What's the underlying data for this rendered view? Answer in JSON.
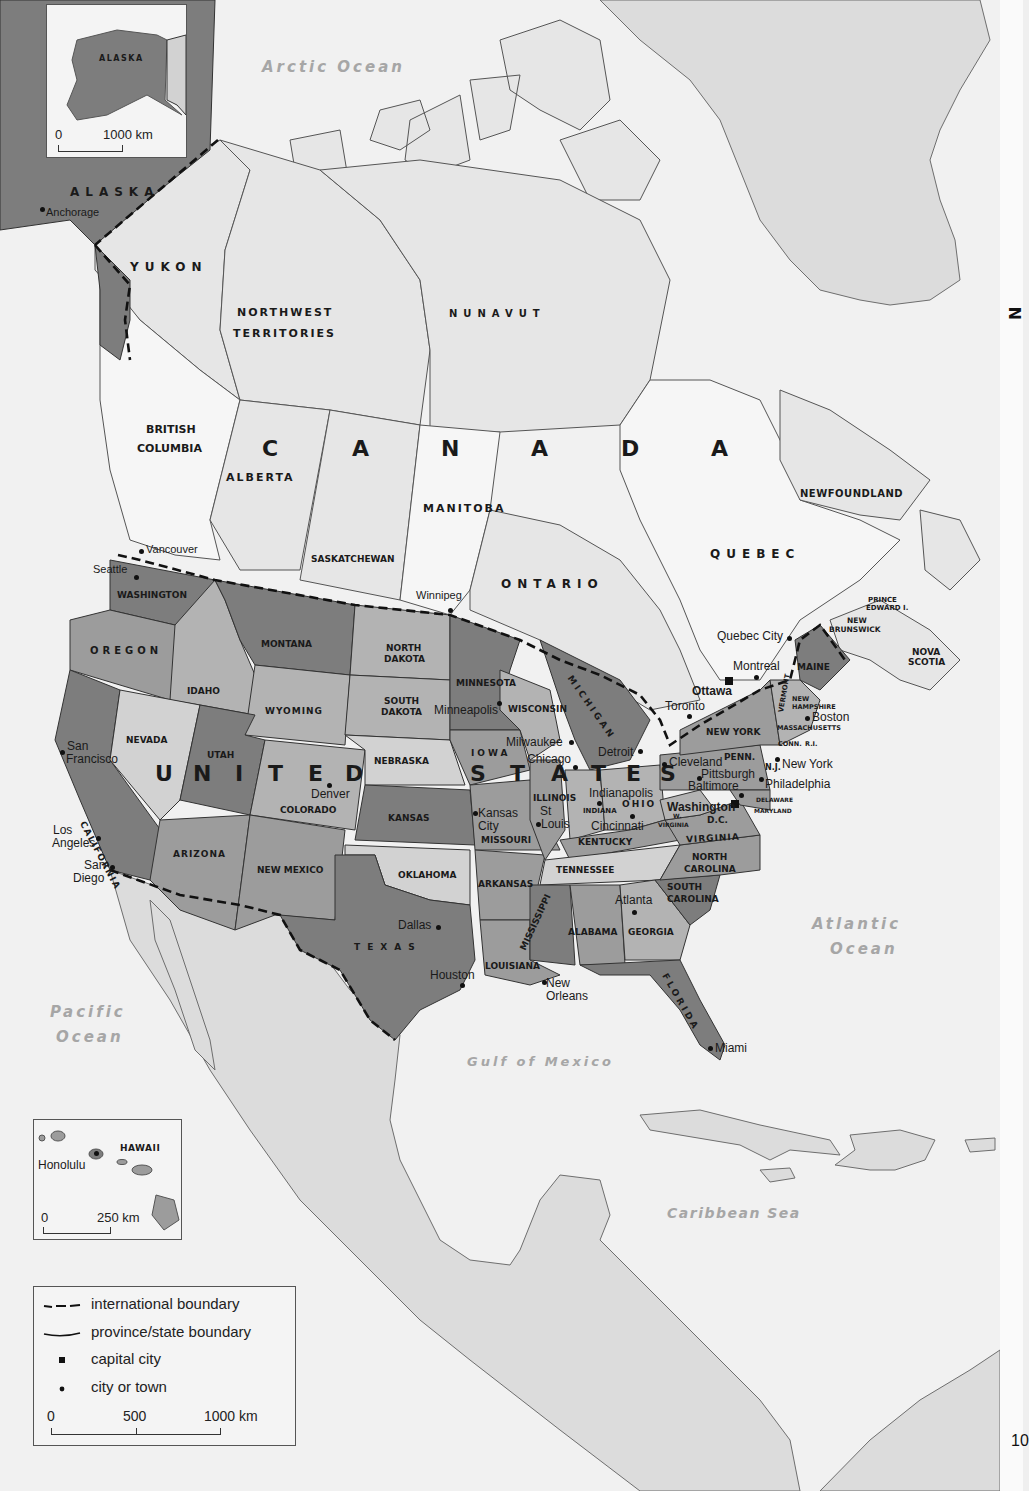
{
  "map": {
    "countries": {
      "canada": "C A N A D A",
      "canada_letters": [
        "C",
        "A",
        "N",
        "A",
        "D",
        "A"
      ],
      "usa_letters": [
        "U",
        "N",
        "I",
        "T",
        "E",
        "D",
        "S",
        "T",
        "A",
        "T",
        "E",
        "S"
      ]
    },
    "oceans": {
      "arctic": "Arctic Ocean",
      "pacific_1": "Pacific",
      "pacific_2": "Ocean",
      "atlantic_1": "Atlantic",
      "atlantic_2": "Ocean",
      "gulf": "Gulf of Mexico",
      "caribbean": "Caribbean Sea"
    },
    "canada_regions": {
      "yukon": "YUKON",
      "nwt_1": "NORTHWEST",
      "nwt_2": "TERRITORIES",
      "nunavut": "NUNAVUT",
      "bc_1": "BRITISH",
      "bc_2": "COLUMBIA",
      "alberta": "ALBERTA",
      "saskatchewan": "SASKATCHEWAN",
      "manitoba": "MANITOBA",
      "ontario": "ONTARIO",
      "quebec": "QUEBEC",
      "newfoundland": "NEWFOUNDLAND",
      "new_brunswick_1": "NEW",
      "new_brunswick_2": "BRUNSWICK",
      "pei_1": "PRINCE",
      "pei_2": "EDWARD I.",
      "nova_scotia_1": "NOVA",
      "nova_scotia_2": "SCOTIA"
    },
    "us_states": {
      "alaska": "ALASKA",
      "washington": "WASHINGTON",
      "oregon": "OREGON",
      "california": "CALIFORNIA",
      "idaho": "IDAHO",
      "nevada": "NEVADA",
      "montana": "MONTANA",
      "wyoming": "WYOMING",
      "utah": "UTAH",
      "colorado": "COLORADO",
      "arizona": "ARIZONA",
      "new_mexico": "NEW MEXICO",
      "north_dakota_1": "NORTH",
      "north_dakota_2": "DAKOTA",
      "south_dakota_1": "SOUTH",
      "south_dakota_2": "DAKOTA",
      "nebraska": "NEBRASKA",
      "kansas": "KANSAS",
      "oklahoma": "OKLAHOMA",
      "texas": "TEXAS",
      "minnesota": "MINNESOTA",
      "iowa": "IOWA",
      "missouri": "MISSOURI",
      "arkansas": "ARKANSAS",
      "louisiana": "LOUISIANA",
      "wisconsin": "WISCONSIN",
      "illinois": "ILLINOIS",
      "michigan": "MICHIGAN",
      "indiana": "INDIANA",
      "ohio": "OHIO",
      "kentucky": "KENTUCKY",
      "tennessee": "TENNESSEE",
      "mississippi": "MISSISSIPPI",
      "alabama": "ALABAMA",
      "georgia": "GEORGIA",
      "florida": "FLORIDA",
      "south_carolina_1": "SOUTH",
      "south_carolina_2": "CAROLINA",
      "north_carolina_1": "NORTH",
      "north_carolina_2": "CAROLINA",
      "virginia": "VIRGINIA",
      "west_virginia_1": "W.",
      "west_virginia_2": "VIRGINIA",
      "maryland": "MARYLAND",
      "delaware": "DELAWARE",
      "new_jersey": "N.J.",
      "penn": "PENN.",
      "new_york": "NEW YORK",
      "vermont": "VERMONT",
      "new_hampshire_1": "NEW",
      "new_hampshire_2": "HAMPSHIRE",
      "massachusetts": "MASSACHUSETTS",
      "conn": "CONN.",
      "ri": "R.I.",
      "maine": "MAINE",
      "dc": "D.C."
    },
    "cities": {
      "anchorage": "Anchorage",
      "vancouver": "Vancouver",
      "seattle": "Seattle",
      "winnipeg": "Winnipeg",
      "quebec_city": "Quebec City",
      "montreal": "Montreal",
      "ottawa": "Ottawa",
      "toronto": "Toronto",
      "boston": "Boston",
      "new_york": "New York",
      "philadelphia": "Philadelphia",
      "pittsburgh": "Pittsburgh",
      "baltimore": "Baltimore",
      "washington": "Washington",
      "cleveland": "Cleveland",
      "detroit": "Detroit",
      "chicago": "Chicago",
      "milwaukee": "Milwaukee",
      "minneapolis": "Minneapolis",
      "indianapolis": "Indianapolis",
      "cincinnati": "Cincinnati",
      "st_louis_1": "St",
      "st_louis_2": "Louis",
      "kansas_city_1": "Kansas",
      "kansas_city_2": "City",
      "denver": "Denver",
      "san_francisco_1": "San",
      "san_francisco_2": "Francisco",
      "los_angeles_1": "Los",
      "los_angeles_2": "Angeles",
      "san_diego_1": "San",
      "san_diego_2": "Diego",
      "dallas": "Dallas",
      "houston": "Houston",
      "new_orleans_1": "New",
      "new_orleans_2": "Orleans",
      "atlanta": "Atlanta",
      "miami": "Miami",
      "honolulu": "Honolulu"
    },
    "capital_cities": [
      "Ottawa",
      "Washington D.C."
    ]
  },
  "insets": {
    "alaska": {
      "label": "ALASKA",
      "scale_start": "0",
      "scale_end": "1000 km"
    },
    "hawaii": {
      "label": "HAWAII",
      "city": "Honolulu",
      "scale_start": "0",
      "scale_end": "250 km"
    }
  },
  "legend": {
    "items": [
      {
        "symbol": "dashed-line",
        "label": "international boundary"
      },
      {
        "symbol": "solid-line",
        "label": "province/state boundary"
      },
      {
        "symbol": "square",
        "label": "capital city"
      },
      {
        "symbol": "dot",
        "label": "city or town"
      }
    ],
    "scale": {
      "start": "0",
      "mid": "500",
      "end": "1000 km"
    }
  },
  "page": {
    "number": "10",
    "side_title_fragment": "N"
  },
  "colors": {
    "water": "#f1f1f1",
    "us_dark": "#7d7d7d",
    "us_mid": "#9c9c9c",
    "us_light": "#b3b3b3",
    "us_pale": "#d2d2d2",
    "canada": "#e6e6e6",
    "other_land": "#dcdcdc",
    "ocean_label": "#a6a6a6"
  }
}
